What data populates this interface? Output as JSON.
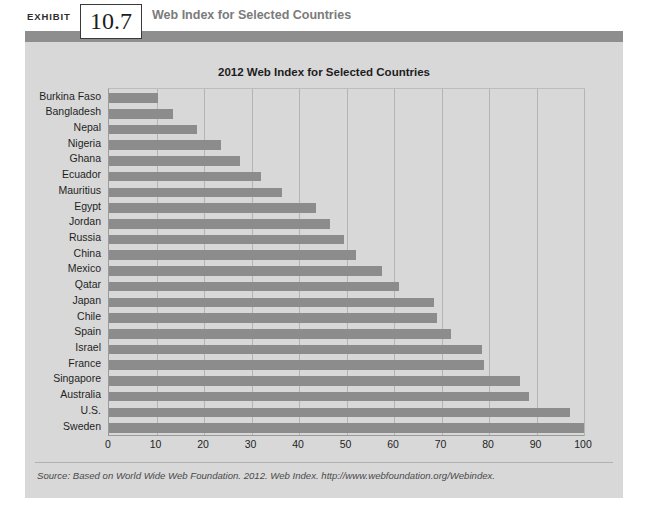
{
  "exhibit": {
    "kicker": "EXHIBIT",
    "number": "10.7",
    "title": "Web Index for Selected Countries"
  },
  "source": {
    "note": "Source: Based on World Wide Web Foundation. 2012. Web Index. http://www.webfoundation.org/Webindex."
  },
  "colors": {
    "band": "#8e8e8e",
    "panel_bg": "#d8d8d8",
    "bar": "#8c8c8c",
    "grid": "#b4b4b4",
    "axis": "#9a9a9a"
  },
  "chart_data": {
    "type": "bar",
    "orientation": "horizontal",
    "title": "2012 Web Index for Selected Countries",
    "xlabel": "",
    "ylabel": "",
    "xlim": [
      0,
      100
    ],
    "xticks": [
      0,
      10,
      20,
      30,
      40,
      50,
      60,
      70,
      80,
      90,
      100
    ],
    "grid": true,
    "legend": null,
    "categories": [
      "Burkina Faso",
      "Bangladesh",
      "Nepal",
      "Nigeria",
      "Ghana",
      "Ecuador",
      "Mauritius",
      "Egypt",
      "Jordan",
      "Russia",
      "China",
      "Mexico",
      "Qatar",
      "Japan",
      "Chile",
      "Spain",
      "Israel",
      "France",
      "Singapore",
      "Australia",
      "U.S.",
      "Sweden"
    ],
    "values": [
      10.3,
      13.5,
      18.5,
      23.5,
      27.5,
      32.0,
      36.5,
      43.5,
      46.5,
      49.5,
      52.0,
      57.5,
      61.0,
      68.5,
      69.0,
      72.0,
      78.5,
      79.0,
      86.5,
      88.5,
      97.0,
      100.0
    ]
  }
}
